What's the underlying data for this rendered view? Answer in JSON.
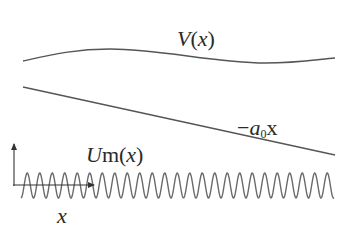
{
  "diagram": {
    "colors": {
      "curve": "#555555",
      "wave": "#6a6a6a",
      "axis": "#333333",
      "text": "#2a2a2a",
      "background": "#ffffff"
    },
    "labels": {
      "V": {
        "main": "V",
        "arg_open": "(",
        "arg": "x",
        "arg_close": ")"
      },
      "tilt": {
        "sign": "−",
        "coef": "a",
        "sub": "0",
        "var": "x"
      },
      "Um": {
        "main": "U",
        "sub": "m",
        "arg_open": "(",
        "arg": "x",
        "arg_close": ")"
      },
      "x_axis": "x"
    },
    "curves": {
      "V": {
        "start": [
          23,
          61
        ],
        "peak": [
          100,
          49
        ],
        "trough": [
          265,
          63
        ],
        "end": [
          335,
          58
        ]
      },
      "tilt_line": {
        "start": [
          23,
          87
        ],
        "end": [
          335,
          155
        ]
      },
      "wave": {
        "x_start": 21,
        "x_end": 334,
        "center_y": 185.5,
        "amplitude": 12.5,
        "period": 12.5,
        "cycles": 25
      }
    },
    "axes": {
      "origin": [
        14,
        185
      ],
      "y_arrow_tip": [
        14,
        142
      ],
      "x_arrow_tip": [
        96,
        185
      ]
    }
  }
}
